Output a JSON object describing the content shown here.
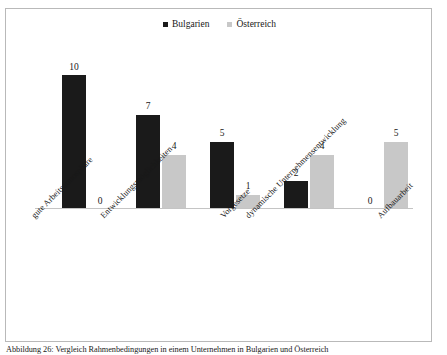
{
  "figure": {
    "caption": "Abbildung 26: Vergleich Rahmenbedingungen in einem Unternehmen in Bulgarien und Österreich"
  },
  "legend": {
    "position": "top-center",
    "entries": [
      {
        "label": "Bulgarien",
        "color": "#1a1a1a"
      },
      {
        "label": "Österreich",
        "color": "#c8c8c8"
      }
    ]
  },
  "chart_data": {
    "type": "bar",
    "title": "",
    "subtitle": "",
    "xlabel": "",
    "ylabel": "",
    "ylim": [
      0,
      10
    ],
    "grid": false,
    "legend_position": "top-center",
    "categories": [
      "gute Arbeitsatmosphäre",
      "Entwicklungsmöglichkeiten",
      "Vorgesetze",
      "dynamische Unternehmensentwicklung",
      "Aufbauarbeit"
    ],
    "series": [
      {
        "name": "Bulgarien",
        "color": "#1a1a1a",
        "values": [
          10,
          7,
          5,
          2,
          0
        ]
      },
      {
        "name": "Österreich",
        "color": "#c8c8c8",
        "values": [
          0,
          4,
          1,
          4,
          5
        ]
      }
    ],
    "data_labels": {
      "Bulgarien": [
        "10",
        "7",
        "5",
        "2",
        "0"
      ],
      "Österreich": [
        "0",
        "4",
        "1",
        "4",
        "5"
      ]
    }
  },
  "groups": [
    {
      "category": "gute Arbeitsatmosphäre",
      "bulgarien": {
        "value": 10,
        "label": "10"
      },
      "oesterreich": {
        "value": 0,
        "label": "0"
      }
    },
    {
      "category": "Entwicklungsmöglichkeiten",
      "bulgarien": {
        "value": 7,
        "label": "7"
      },
      "oesterreich": {
        "value": 4,
        "label": "4"
      }
    },
    {
      "category": "Vorgesetze",
      "bulgarien": {
        "value": 5,
        "label": "5"
      },
      "oesterreich": {
        "value": 1,
        "label": "1"
      }
    },
    {
      "category": "dynamische Unternehmensentwicklung",
      "bulgarien": {
        "value": 2,
        "label": "2"
      },
      "oesterreich": {
        "value": 4,
        "label": "4"
      }
    },
    {
      "category": "Aufbauarbeit",
      "bulgarien": {
        "value": 0,
        "label": "0"
      },
      "oesterreich": {
        "value": 5,
        "label": "5"
      }
    }
  ]
}
